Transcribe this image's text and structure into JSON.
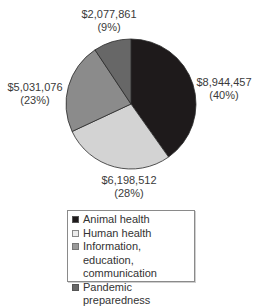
{
  "chart_data": {
    "type": "pie",
    "title": "",
    "start_angle_deg": 0,
    "direction": "clockwise",
    "categories": [
      "Animal health",
      "Human health",
      "Information, education, communication",
      "Pandemic preparedness"
    ],
    "values": [
      8944457,
      6198512,
      5031076,
      2077861
    ],
    "percentages": [
      40,
      28,
      23,
      9
    ],
    "colors": [
      "#1e1a1b",
      "#d3d3d3",
      "#8b8b8b",
      "#676767"
    ],
    "labels": [
      {
        "amount": "$8,944,457",
        "pct": "(40%)"
      },
      {
        "amount": "$6,198,512",
        "pct": "(28%)"
      },
      {
        "amount": "$5,031,076",
        "pct": "(23%)"
      },
      {
        "amount": "$2,077,861",
        "pct": "(9%)"
      }
    ],
    "legend": {
      "position": "bottom",
      "items": [
        {
          "label": "Animal health",
          "color": "#1e1a1b"
        },
        {
          "label": "Human health",
          "color": "#ececec"
        },
        {
          "label": "Information, education,",
          "label2": "communication",
          "color": "#9a9a9a"
        },
        {
          "label": "Pandemic preparedness",
          "color": "#676767"
        }
      ]
    }
  }
}
